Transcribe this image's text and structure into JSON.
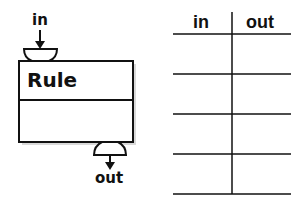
{
  "rule_block": {
    "title": "Rule",
    "input_label": "in",
    "output_label": "out"
  },
  "table": {
    "headers": [
      "in",
      "out"
    ],
    "rows": [
      [
        "",
        ""
      ],
      [
        "",
        ""
      ],
      [
        "",
        ""
      ],
      [
        "",
        ""
      ]
    ]
  },
  "colors": {
    "stroke": "#111111",
    "background": "#ffffff",
    "shadow": "#c8c8c8"
  }
}
